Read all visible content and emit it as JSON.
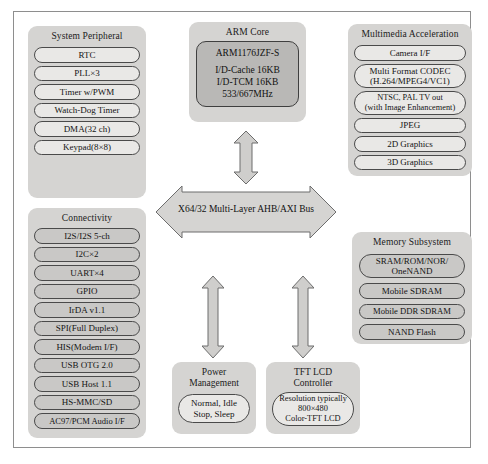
{
  "diagram": {
    "bus": {
      "label": "X64/32 Multi-Layer AHB/AXI Bus",
      "shape": "double-headed-horizontal-arrow",
      "fill": "#d5d4d2"
    },
    "colors": {
      "panel_fill": "#d5d4d2",
      "pill_fill": "#e9e8e6",
      "pill_fill_dark": "#c9c8c6",
      "core_fill": "#b9b8b6",
      "outline": "#4a4a4a",
      "frame": "#8e8e8e",
      "background": "#ffffff"
    },
    "groups": {
      "system_peripheral": {
        "title": "System Peripheral",
        "items": [
          "RTC",
          "PLL×3",
          "Timer w/PWM",
          "Watch-Dog Timer",
          "DMA(32 ch)",
          "Keypad(8×8)"
        ]
      },
      "arm_core": {
        "title": "ARM Core",
        "core_name": "ARM1176JZF-S",
        "specs": [
          "I/D-Cache 16KB",
          "I/D-TCM 16KB",
          "533/667MHz"
        ]
      },
      "multimedia_acceleration": {
        "title": "Multimedia Acceleration",
        "items": [
          "Camera I/F",
          "Multi Format CODEC\n(H.264/MPEG4/VC1)",
          "NTSC, PAL TV out\n(with Image Enhancement)",
          "JPEG",
          "2D Graphics",
          "3D Graphics"
        ]
      },
      "connectivity": {
        "title": "Connectivity",
        "items": [
          "I2S/I2S 5-ch",
          "I2C×2",
          "UART×4",
          "GPIO",
          "IrDA v1.1",
          "SPI(Full Duplex)",
          "HIS(Modem I/F)",
          "USB OTG 2.0",
          "USB Host 1.1",
          "HS-MMC/SD",
          "AC97/PCM Audio I/F"
        ]
      },
      "memory_subsystem": {
        "title": "Memory Subsystem",
        "items": [
          "SRAM/ROM/NOR/\nOneNAND",
          "Mobile SDRAM",
          "Mobile DDR SDRAM",
          "NAND Flash"
        ]
      },
      "power_management": {
        "title": "Power\nManagement",
        "title_line1": "Power",
        "title_line2": "Management",
        "item": "Normal, Idle\nStop, Sleep",
        "item_line1": "Normal, Idle",
        "item_line2": "Stop, Sleep"
      },
      "tft_lcd_controller": {
        "title_line1": "TFT LCD",
        "title_line2": "Controller",
        "item_line1": "Resolution typically",
        "item_line2": "800×480",
        "item_line3": "Color-TFT LCD"
      }
    },
    "arrows": [
      {
        "name": "arm-core-to-bus",
        "direction": "vertical-double",
        "position": "above-bus"
      },
      {
        "name": "bus-to-power-management",
        "direction": "vertical-double",
        "position": "below-bus-left"
      },
      {
        "name": "bus-to-tft-lcd-controller",
        "direction": "vertical-double",
        "position": "below-bus-right"
      }
    ]
  }
}
